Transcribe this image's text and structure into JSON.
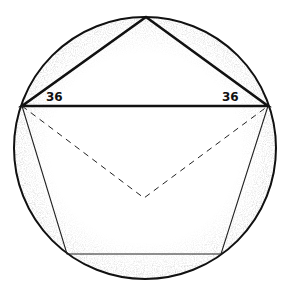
{
  "diagram": {
    "circle": {
      "cx": 145,
      "cy": 148,
      "r": 131
    },
    "vertices": {
      "top": [
        146,
        17
      ],
      "left": [
        22,
        106
      ],
      "right": [
        268,
        106
      ],
      "bottom_left": [
        67,
        254
      ],
      "bottom_right": [
        221,
        254
      ]
    },
    "center": [
      144,
      198
    ],
    "labels": {
      "left_angle": "36",
      "right_angle": "36"
    },
    "colors": {
      "stroke": "#111111",
      "shade": "#9a9a9a"
    }
  }
}
